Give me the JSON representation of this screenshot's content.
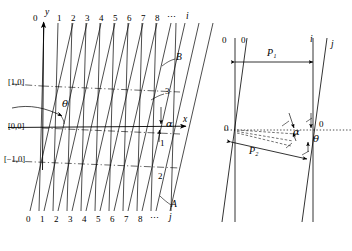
{
  "figure": {
    "colors": {
      "line": "#000000",
      "dash": "#000000",
      "background": "#ffffff"
    }
  },
  "left_panel": {
    "axis_labels": {
      "y": "y",
      "x": "x"
    },
    "top_indices": [
      "0",
      "1",
      "2",
      "3",
      "4",
      "5",
      "6",
      "7",
      "8"
    ],
    "top_ellipsis": "⋯",
    "top_index_name": "i",
    "bottom_indices": [
      "0",
      "1",
      "2",
      "3",
      "4",
      "5",
      "6",
      "7",
      "8"
    ],
    "bottom_ellipsis": "⋯",
    "bottom_index_name": "j",
    "bracket_labels": [
      "[1,0]",
      "[0,0]",
      "[−1,0]"
    ],
    "angle_theta": "θ",
    "angle_alpha": "α",
    "line_labels": [
      "B",
      "3",
      "1",
      "2",
      "A"
    ]
  },
  "right_panel": {
    "top_labels": [
      "0",
      "0",
      "i",
      "j"
    ],
    "mid_labels": [
      "0",
      "0"
    ],
    "spacing_labels": [
      "P₁",
      "P₂"
    ],
    "angle_alpha": "α",
    "angle_theta": "θ"
  }
}
